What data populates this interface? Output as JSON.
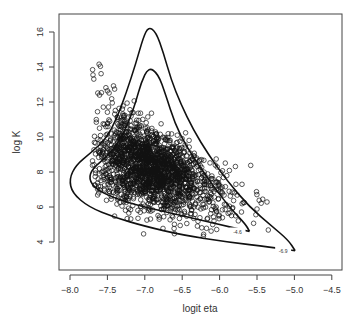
{
  "chart_data": {
    "type": "scatter",
    "title": "",
    "xlabel": "logit eta",
    "ylabel": "log K",
    "xlim": [
      -8.1,
      -4.4
    ],
    "ylim": [
      2.9,
      17.0
    ],
    "x_ticks": [
      -8.0,
      -7.5,
      -7.0,
      -6.5,
      -6.0,
      -5.5,
      -5.0,
      -4.5
    ],
    "x_tick_labels": [
      "−8.0",
      "−7.5",
      "−7.0",
      "−6.5",
      "−6.0",
      "−5.5",
      "−5.0",
      "−4.5"
    ],
    "y_ticks": [
      4,
      6,
      8,
      10,
      12,
      14,
      16
    ],
    "y_tick_labels": [
      "4",
      "6",
      "8",
      "10",
      "12",
      "14",
      "16"
    ],
    "grid": false,
    "legend": null,
    "point_style": "open circle",
    "scatter_summary": {
      "approx_n_points": 2000,
      "dense_core_center": [
        -6.9,
        8.0
      ],
      "x_range": [
        -7.7,
        -5.3
      ],
      "y_range": [
        4.3,
        16.7
      ]
    },
    "contours": [
      {
        "label": "-4.6",
        "points": [
          [
            -5.6,
            4.6
          ],
          [
            -5.9,
            4.9
          ],
          [
            -6.3,
            5.3
          ],
          [
            -6.7,
            5.7
          ],
          [
            -7.1,
            6.1
          ],
          [
            -7.4,
            6.5
          ],
          [
            -7.65,
            7.0
          ],
          [
            -7.75,
            7.6
          ],
          [
            -7.7,
            8.2
          ],
          [
            -7.5,
            8.9
          ],
          [
            -7.35,
            9.7
          ],
          [
            -7.22,
            10.8
          ],
          [
            -7.12,
            12.0
          ],
          [
            -7.05,
            13.1
          ],
          [
            -6.95,
            14.0
          ],
          [
            -6.82,
            13.6
          ],
          [
            -6.72,
            12.4
          ],
          [
            -6.6,
            10.8
          ],
          [
            -6.45,
            9.5
          ],
          [
            -6.25,
            8.2
          ],
          [
            -6.05,
            7.0
          ],
          [
            -5.85,
            5.9
          ],
          [
            -5.65,
            5.0
          ],
          [
            -5.6,
            4.6
          ]
        ]
      },
      {
        "label": "-6.9",
        "points": [
          [
            -4.99,
            3.5
          ],
          [
            -5.3,
            3.7
          ],
          [
            -5.9,
            4.0
          ],
          [
            -6.5,
            4.4
          ],
          [
            -7.0,
            4.9
          ],
          [
            -7.4,
            5.4
          ],
          [
            -7.75,
            6.0
          ],
          [
            -7.97,
            6.8
          ],
          [
            -8.01,
            7.6
          ],
          [
            -7.92,
            8.4
          ],
          [
            -7.72,
            9.1
          ],
          [
            -7.52,
            9.9
          ],
          [
            -7.38,
            11.0
          ],
          [
            -7.25,
            12.5
          ],
          [
            -7.12,
            14.2
          ],
          [
            -7.02,
            15.7
          ],
          [
            -6.95,
            16.3
          ],
          [
            -6.85,
            16.0
          ],
          [
            -6.75,
            14.8
          ],
          [
            -6.65,
            13.3
          ],
          [
            -6.52,
            11.9
          ],
          [
            -6.35,
            10.4
          ],
          [
            -6.15,
            9.0
          ],
          [
            -5.9,
            7.5
          ],
          [
            -5.6,
            6.0
          ],
          [
            -5.3,
            4.9
          ],
          [
            -5.08,
            4.1
          ],
          [
            -4.99,
            3.5
          ]
        ]
      }
    ]
  }
}
